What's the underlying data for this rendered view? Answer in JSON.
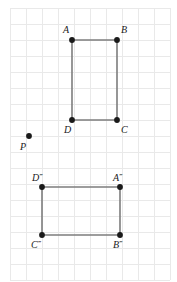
{
  "figure": {
    "background_color": "#ffffff",
    "grid": {
      "visible": true,
      "color": "#e9e9e9",
      "spacing_px": 16,
      "origin_x": 10,
      "origin_y": 8,
      "columns": 10,
      "rows": 17
    },
    "edge_color": "#7d7d7d",
    "vertex_color": "#1a1a1a",
    "label_color": "#1a1a1a"
  },
  "shapes": [
    {
      "name": "rectangle-abcd",
      "closed": true,
      "vertices": [
        {
          "label": "A",
          "x": 72,
          "y": 40,
          "label_x": 63,
          "label_y": 33
        },
        {
          "label": "B",
          "x": 117,
          "y": 40,
          "label_x": 121,
          "label_y": 33
        },
        {
          "label": "C",
          "x": 117,
          "y": 120,
          "label_x": 121,
          "label_y": 133
        },
        {
          "label": "D",
          "x": 72,
          "y": 120,
          "label_x": 64,
          "label_y": 133
        }
      ]
    },
    {
      "name": "rectangle-abcd-triple-prime",
      "closed": true,
      "vertices": [
        {
          "label": "D",
          "primes": "‴",
          "x": 42,
          "y": 187,
          "label_x": 32,
          "label_y": 181
        },
        {
          "label": "A",
          "primes": "‴",
          "x": 120,
          "y": 187,
          "label_x": 113,
          "label_y": 181
        },
        {
          "label": "B",
          "primes": "‴",
          "x": 120,
          "y": 235,
          "label_x": 113,
          "label_y": 248
        },
        {
          "label": "C",
          "primes": "‴",
          "x": 42,
          "y": 235,
          "label_x": 31,
          "label_y": 248
        }
      ]
    }
  ],
  "points": [
    {
      "label": "P",
      "x": 29,
      "y": 136,
      "label_x": 20,
      "label_y": 150
    }
  ],
  "labels": {
    "A": "A",
    "B": "B",
    "C": "C",
    "D": "D",
    "P": "P",
    "A_triple": "A‴",
    "B_triple": "B‴",
    "C_triple": "C‴",
    "D_triple": "D‴"
  }
}
